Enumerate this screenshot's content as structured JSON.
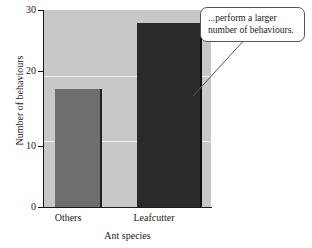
{
  "chart_data": {
    "type": "bar",
    "title": "",
    "categories": [
      "Others",
      "Leafcutter"
    ],
    "values": [
      18,
      28
    ],
    "series": [
      {
        "name": "Number of behaviours",
        "values": [
          18,
          28
        ]
      }
    ],
    "xlabel": "Ant species",
    "ylabel": "Number of behaviours",
    "ylim": [
      0,
      30
    ],
    "yticks": [
      0,
      10,
      20,
      30
    ],
    "ytick_labels": [
      "0",
      "10",
      "20",
      "30"
    ],
    "grid": true,
    "legend": "none",
    "bar_colors": [
      "#6e6e6e",
      "#2a2a2a"
    ],
    "plot_background": "#c8c8c8",
    "annotations": [
      {
        "text": "...perform a larger number of behaviours.",
        "points_to": "Leafcutter"
      }
    ]
  },
  "axis": {
    "y_title": "Number of behaviours",
    "x_title": "Ant species",
    "y_tick_0": "0",
    "y_tick_10": "10",
    "y_tick_20": "20",
    "y_tick_30": "30",
    "x_tick_1": "Others",
    "x_tick_2": "Leafcutter"
  },
  "callout": {
    "text": "...perform a larger number of behaviours."
  }
}
